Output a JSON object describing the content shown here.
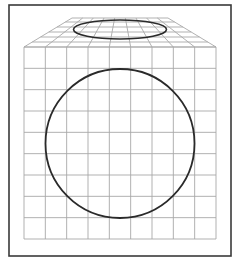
{
  "figure": {
    "colors": {
      "background": "#ffffff",
      "frame": "#3a3a3a",
      "grid": "#a8a8a8",
      "shape": "#2a2a2a"
    },
    "frame": {
      "x": 9,
      "y": 5,
      "width": 222,
      "height": 251
    },
    "front_face": {
      "x": 24,
      "y": 47,
      "width": 192,
      "height": 192,
      "columns": 9,
      "rows": 9,
      "circle": {
        "cx": 120,
        "cy": 143.5,
        "r": 74.5
      }
    },
    "top_face": {
      "top_edge": {
        "y": 18,
        "x1": 72,
        "x2": 168
      },
      "bottom_edge": {
        "y": 47,
        "x1": 24,
        "x2": 216
      },
      "columns": 9,
      "row_lines_y": [
        18,
        22,
        27,
        32,
        37,
        42,
        47
      ],
      "ellipse": {
        "cx": 120,
        "cy": 29.5,
        "rx": 46.5,
        "ry": 9.5
      }
    }
  }
}
